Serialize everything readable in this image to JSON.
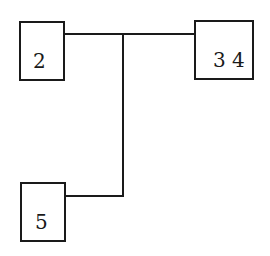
{
  "diagram": {
    "type": "tree-connector",
    "nodes": [
      {
        "id": "node-2",
        "label": "2"
      },
      {
        "id": "node-34",
        "label": "3 4"
      },
      {
        "id": "node-5",
        "label": "5"
      }
    ],
    "edges": [
      {
        "from": "node-2",
        "to": "node-34"
      },
      {
        "from": "node-5",
        "to": "junction-top"
      }
    ],
    "colors": {
      "stroke": "#1a1a1a",
      "background": "#ffffff"
    }
  }
}
